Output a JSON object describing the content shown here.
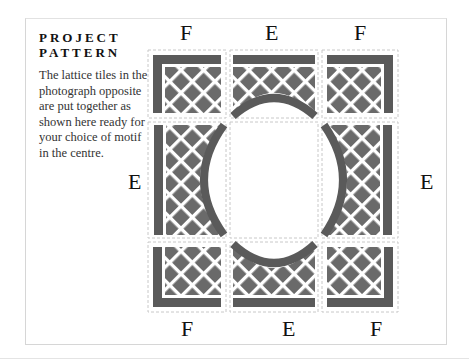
{
  "sidebar": {
    "heading_line1": "PROJECT",
    "heading_line2": "PATTERN",
    "description": "The lattice tiles in the photograph opposite are put together as shown here ready for your choice of motif in the centre."
  },
  "labels": {
    "top_left": "F",
    "top_middle": "E",
    "top_right": "F",
    "middle_left": "E",
    "middle_right": "E",
    "bottom_left": "F",
    "bottom_middle": "E",
    "bottom_right": "F"
  },
  "colors": {
    "tile_dark": "#5a5a5a",
    "tile_diamond": "#6e6e6e",
    "dash": "#c8c8c8"
  }
}
